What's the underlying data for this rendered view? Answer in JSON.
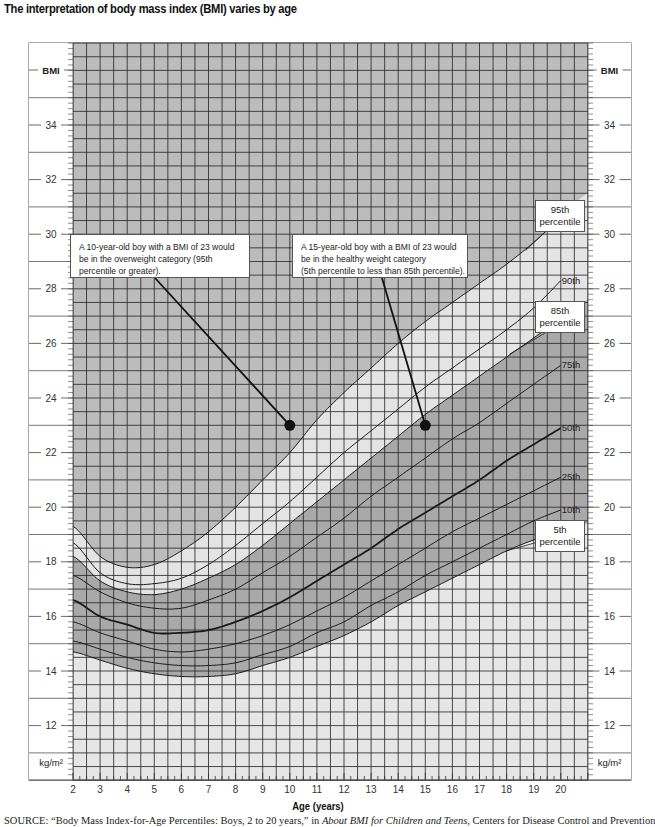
{
  "title": "The interpretation of body mass index (BMI) varies by age",
  "axis": {
    "xlabel": "Age (years)",
    "y_top_label": "BMI",
    "y_bottom_label": "kg/m²",
    "x_ticks": [
      2,
      3,
      4,
      5,
      6,
      7,
      8,
      9,
      10,
      11,
      12,
      13,
      14,
      15,
      16,
      17,
      18,
      19,
      20
    ],
    "y_ticks": [
      12,
      14,
      16,
      18,
      20,
      22,
      24,
      26,
      28,
      30,
      32,
      34
    ]
  },
  "callouts": {
    "left": {
      "lines": [
        "A 10-year-old boy with a BMI of 23 would",
        "be in the overweight category (95th",
        "percentile or greater)."
      ]
    },
    "right": {
      "lines": [
        "A 15-year-old boy with a BMI of 23 would",
        "be in the healthy weight category",
        "(5th percentile to less than 85th percentile)."
      ]
    }
  },
  "percentile_boxes": {
    "p95": [
      "95th",
      "percentile"
    ],
    "p85": [
      "85th",
      "percentile"
    ],
    "p5": [
      "5th",
      "percentile"
    ]
  },
  "curve_labels": {
    "p90": "90th",
    "p75": "75th",
    "p50": "50th",
    "p25": "25th",
    "p10": "10th"
  },
  "source": {
    "prefix": "SOURCE:",
    "text": " “Body Mass Index-for-Age Percentiles: Boys, 2 to 20 years,” in ",
    "italic": "About BMI for Children and Teens",
    "suffix": ", Centers for Disease Control and Prevention"
  },
  "colors": {
    "overweight_band": "#bcbcbc",
    "at_risk_band": "#e4e4e4",
    "healthy_band": "#a9a9a9",
    "underweight_band": "#e6e6e6",
    "grid_line": "#222222",
    "curve": "#1a1a1a"
  },
  "chart_data": {
    "type": "line",
    "title": "The interpretation of body mass index (BMI) varies by age",
    "xlabel": "Age (years)",
    "ylabel": "BMI (kg/m²)",
    "xlim": [
      2,
      21
    ],
    "ylim": [
      10,
      37
    ],
    "grid": true,
    "x": [
      2,
      3,
      4,
      5,
      6,
      7,
      8,
      9,
      10,
      11,
      12,
      13,
      14,
      15,
      16,
      17,
      18,
      19,
      20
    ],
    "series": [
      {
        "name": "95th percentile",
        "values": [
          19.3,
          18.2,
          17.8,
          17.9,
          18.4,
          19.1,
          20.0,
          21.0,
          22.0,
          23.2,
          24.2,
          25.1,
          26.0,
          26.8,
          27.5,
          28.2,
          28.9,
          29.7,
          30.6
        ]
      },
      {
        "name": "90th",
        "values": [
          18.7,
          17.6,
          17.2,
          17.2,
          17.4,
          17.9,
          18.6,
          19.4,
          20.2,
          21.1,
          22.0,
          22.8,
          23.6,
          24.4,
          25.1,
          25.8,
          26.5,
          27.3,
          28.3
        ]
      },
      {
        "name": "85th percentile",
        "values": [
          18.2,
          17.3,
          16.9,
          16.8,
          17.0,
          17.4,
          17.9,
          18.6,
          19.4,
          20.2,
          21.0,
          21.8,
          22.6,
          23.4,
          24.1,
          24.8,
          25.5,
          26.2,
          26.9
        ]
      },
      {
        "name": "75th",
        "values": [
          17.5,
          16.9,
          16.5,
          16.3,
          16.3,
          16.6,
          17.0,
          17.6,
          18.2,
          18.9,
          19.6,
          20.4,
          21.1,
          21.8,
          22.5,
          23.1,
          23.8,
          24.5,
          25.2
        ]
      },
      {
        "name": "50th",
        "values": [
          16.6,
          16.0,
          15.7,
          15.4,
          15.4,
          15.5,
          15.8,
          16.2,
          16.7,
          17.3,
          17.9,
          18.5,
          19.2,
          19.8,
          20.4,
          21.0,
          21.7,
          22.3,
          22.9
        ]
      },
      {
        "name": "25th",
        "values": [
          15.8,
          15.4,
          15.1,
          14.8,
          14.7,
          14.8,
          15.0,
          15.3,
          15.7,
          16.2,
          16.7,
          17.3,
          17.9,
          18.5,
          19.1,
          19.6,
          20.1,
          20.6,
          21.1
        ]
      },
      {
        "name": "10th",
        "values": [
          15.1,
          14.8,
          14.5,
          14.3,
          14.2,
          14.2,
          14.3,
          14.6,
          14.9,
          15.4,
          15.8,
          16.4,
          16.9,
          17.5,
          18.0,
          18.5,
          19.0,
          19.5,
          19.9
        ]
      },
      {
        "name": "5th percentile",
        "values": [
          14.7,
          14.4,
          14.1,
          13.9,
          13.8,
          13.8,
          13.9,
          14.2,
          14.5,
          14.9,
          15.3,
          15.8,
          16.4,
          16.9,
          17.4,
          17.9,
          18.4,
          18.8,
          19.1
        ]
      }
    ],
    "points": [
      {
        "label": "10-year-old boy, BMI 23",
        "x": 10,
        "y": 23,
        "category": "overweight (95th percentile or greater)"
      },
      {
        "label": "15-year-old boy, BMI 23",
        "x": 15,
        "y": 23,
        "category": "healthy weight (5th to <85th percentile)"
      }
    ],
    "annotations": [
      "A 10-year-old boy with a BMI of 23 would be in the overweight category (95th percentile or greater).",
      "A 15-year-old boy with a BMI of 23 would be in the healthy weight category (5th percentile to less than 85th percentile)."
    ]
  }
}
